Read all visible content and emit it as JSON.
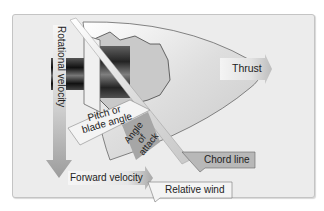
{
  "diagram": {
    "type": "propeller blade aerodynamics",
    "labels": {
      "thrust": "Thrust",
      "rotational_velocity": "Rotational velocity",
      "pitch_line1": "Pitch or",
      "pitch_line2": "blade angle",
      "aoa_line1": "Angle",
      "aoa_line2": "of",
      "aoa_line3": "attack",
      "chord_line": "Chord line",
      "forward_velocity": "Forward velocity",
      "relative_wind": "Relative wind"
    },
    "colors": {
      "background": "#ececec",
      "border": "#c4c4c4",
      "arrow_gray": "#a8a8a8",
      "label_box": "#f4f4f4",
      "hub_dark": "#1a1a1a"
    }
  }
}
